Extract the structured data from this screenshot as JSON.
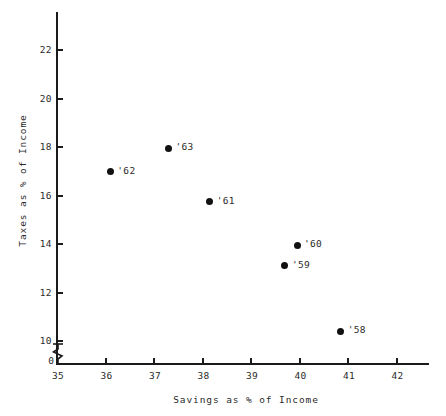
{
  "chart_data": {
    "type": "scatter",
    "title": "",
    "xlabel": "Savings as % of Income",
    "ylabel": "Taxes as % of Income",
    "xlim": [
      35,
      42.6
    ],
    "ylim": [
      10,
      22.8
    ],
    "xticks": [
      "35",
      "36",
      "37",
      "38",
      "39",
      "40",
      "41",
      "42"
    ],
    "xtick_values": [
      35,
      36,
      37,
      38,
      39,
      40,
      41,
      42
    ],
    "yticks": [
      "10",
      "12",
      "14",
      "16",
      "18",
      "20",
      "22"
    ],
    "ytick_values": [
      10,
      12,
      14,
      16,
      18,
      20,
      22
    ],
    "grid": false,
    "legend": "none",
    "y_axis_break": true,
    "origin_label": "0",
    "points": [
      {
        "label": "'63",
        "x": 37.3,
        "y": 17.95
      },
      {
        "label": "'62",
        "x": 36.1,
        "y": 16.97
      },
      {
        "label": "'61",
        "x": 38.15,
        "y": 15.75
      },
      {
        "label": "'60",
        "x": 39.95,
        "y": 13.95
      },
      {
        "label": "'59",
        "x": 39.7,
        "y": 13.1
      },
      {
        "label": "'58",
        "x": 40.85,
        "y": 10.4
      }
    ],
    "series": [
      {
        "name": "Years 1958-1963",
        "x": [
          36.1,
          37.3,
          38.15,
          39.7,
          39.95,
          40.85
        ],
        "y": [
          16.97,
          17.95,
          15.75,
          13.1,
          13.95,
          10.4
        ],
        "point_labels": [
          "'62",
          "'63",
          "'61",
          "'59",
          "'60",
          "'58"
        ]
      }
    ],
    "colors": {
      "marker": "#111111",
      "axis": "#1a1a1a",
      "text": "#2b2b2b",
      "background": "#ffffff"
    }
  }
}
